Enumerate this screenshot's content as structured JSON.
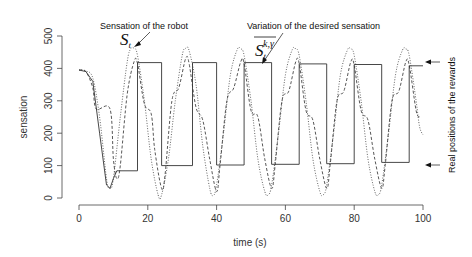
{
  "chart_data": {
    "type": "line",
    "title": "",
    "xlabel": "time (s)",
    "ylabel": "sensation",
    "xlim": [
      0,
      100
    ],
    "ylim": [
      0,
      500
    ],
    "xticks": [
      0,
      20,
      40,
      60,
      80,
      100
    ],
    "yticks": [
      0,
      100,
      200,
      300,
      400,
      500
    ],
    "grid": false,
    "legend": null,
    "series": [
      {
        "name": "Sensation of the robot (S_t)",
        "style": "dotted",
        "points": [
          [
            0,
            395
          ],
          [
            2,
            392
          ],
          [
            4,
            370
          ],
          [
            6,
            250
          ],
          [
            8,
            60
          ],
          [
            9,
            30
          ],
          [
            10,
            60
          ],
          [
            12,
            250
          ],
          [
            14,
            420
          ],
          [
            15,
            460
          ],
          [
            16,
            462
          ],
          [
            17,
            440
          ],
          [
            19,
            300
          ],
          [
            21,
            120
          ],
          [
            23,
            10
          ],
          [
            24,
            10
          ],
          [
            26,
            120
          ],
          [
            28,
            300
          ],
          [
            30,
            440
          ],
          [
            31,
            462
          ],
          [
            32,
            455
          ],
          [
            34,
            350
          ],
          [
            36,
            160
          ],
          [
            38,
            30
          ],
          [
            39,
            8
          ],
          [
            40,
            40
          ],
          [
            42,
            200
          ],
          [
            44,
            380
          ],
          [
            46,
            458
          ],
          [
            47,
            460
          ],
          [
            48,
            440
          ],
          [
            50,
            300
          ],
          [
            52,
            120
          ],
          [
            54,
            20
          ],
          [
            55,
            10
          ],
          [
            56,
            40
          ],
          [
            58,
            200
          ],
          [
            60,
            380
          ],
          [
            62,
            458
          ],
          [
            63,
            460
          ],
          [
            64,
            440
          ],
          [
            66,
            300
          ],
          [
            68,
            120
          ],
          [
            70,
            20
          ],
          [
            71,
            10
          ],
          [
            72,
            40
          ],
          [
            74,
            200
          ],
          [
            76,
            380
          ],
          [
            78,
            456
          ],
          [
            79,
            460
          ],
          [
            80,
            440
          ],
          [
            82,
            300
          ],
          [
            84,
            120
          ],
          [
            86,
            20
          ],
          [
            87,
            10
          ],
          [
            88,
            40
          ],
          [
            90,
            200
          ],
          [
            92,
            380
          ],
          [
            94,
            456
          ],
          [
            95,
            460
          ],
          [
            96,
            440
          ],
          [
            98,
            300
          ],
          [
            99,
            220
          ],
          [
            100,
            195
          ]
        ]
      },
      {
        "name": "Variation of the desired sensation (S_t^{k,γ})",
        "style": "dashed",
        "points": [
          [
            0,
            395
          ],
          [
            2,
            390
          ],
          [
            4,
            340
          ],
          [
            5,
            275
          ],
          [
            9,
            275
          ],
          [
            10,
            120
          ],
          [
            11,
            60
          ],
          [
            12,
            100
          ],
          [
            14,
            320
          ],
          [
            16,
            420
          ],
          [
            17,
            415
          ],
          [
            19,
            290
          ],
          [
            21,
            260
          ],
          [
            22,
            150
          ],
          [
            24,
            30
          ],
          [
            25,
            70
          ],
          [
            27,
            300
          ],
          [
            29,
            340
          ],
          [
            31,
            430
          ],
          [
            32,
            415
          ],
          [
            34,
            280
          ],
          [
            36,
            240
          ],
          [
            38,
            120
          ],
          [
            40,
            20
          ],
          [
            41,
            100
          ],
          [
            43,
            300
          ],
          [
            45,
            340
          ],
          [
            47,
            420
          ],
          [
            48,
            415
          ],
          [
            50,
            270
          ],
          [
            52,
            250
          ],
          [
            54,
            120
          ],
          [
            56,
            30
          ],
          [
            57,
            100
          ],
          [
            59,
            300
          ],
          [
            61,
            330
          ],
          [
            63,
            420
          ],
          [
            64,
            415
          ],
          [
            66,
            270
          ],
          [
            68,
            240
          ],
          [
            70,
            120
          ],
          [
            72,
            30
          ],
          [
            73,
            100
          ],
          [
            75,
            300
          ],
          [
            77,
            330
          ],
          [
            79,
            420
          ],
          [
            80,
            410
          ],
          [
            82,
            270
          ],
          [
            84,
            240
          ],
          [
            86,
            120
          ],
          [
            88,
            30
          ],
          [
            89,
            100
          ],
          [
            91,
            300
          ],
          [
            93,
            330
          ],
          [
            95,
            420
          ],
          [
            96,
            410
          ],
          [
            98,
            270
          ],
          [
            99,
            250
          ]
        ]
      },
      {
        "name": "Real positions of the rewards",
        "style": "solid-step",
        "points": [
          [
            0,
            395
          ],
          [
            2,
            390
          ],
          [
            4,
            360
          ],
          [
            6,
            200
          ],
          [
            8,
            40
          ],
          [
            9,
            30
          ],
          [
            10,
            60
          ],
          [
            11,
            84
          ],
          [
            17,
            84
          ],
          [
            17,
            418
          ],
          [
            24,
            418
          ],
          [
            24,
            100
          ],
          [
            33,
            100
          ],
          [
            33,
            418
          ],
          [
            40,
            418
          ],
          [
            40,
            102
          ],
          [
            48,
            102
          ],
          [
            48,
            418
          ],
          [
            56,
            418
          ],
          [
            56,
            104
          ],
          [
            64,
            104
          ],
          [
            64,
            414
          ],
          [
            72,
            414
          ],
          [
            72,
            106
          ],
          [
            80,
            106
          ],
          [
            80,
            412
          ],
          [
            88,
            412
          ],
          [
            88,
            110
          ],
          [
            96,
            110
          ],
          [
            96,
            408
          ],
          [
            100,
            408
          ]
        ]
      }
    ],
    "annotations": [
      {
        "text": "Sensation of the robot",
        "symbol": "S",
        "subscript": "t"
      },
      {
        "text": "Variation of the desired sensation",
        "symbol": "S",
        "subscript": "t",
        "superscript": "k,γ",
        "overline": true
      },
      {
        "text": "Real positions of the rewards",
        "arrows_at_y": [
          418,
          100
        ],
        "rotated": true
      }
    ]
  },
  "labels": {
    "xlabel": "time (s)",
    "ylabel": "sensation",
    "annot_robot": "Sensation of the robot",
    "annot_desired": "Variation of the desired sensation",
    "annot_rewards": "Real positions of the rewards",
    "sym_S": "S",
    "sym_t": "t",
    "sym_kg": "k,γ"
  }
}
